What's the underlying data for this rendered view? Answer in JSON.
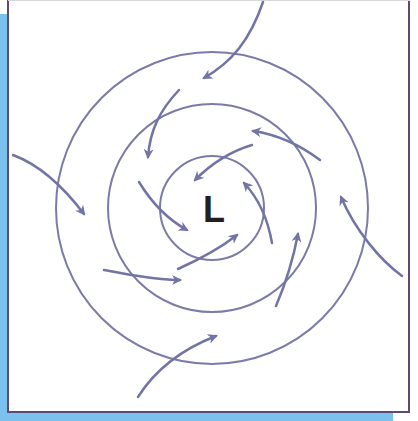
{
  "diagram": {
    "center_label": "L",
    "colors": {
      "background_accent": "#7cc0ee",
      "border": "#5b4b73",
      "isobar": "#7b7aa9",
      "arrow": "#7274a6",
      "label": "#231f20"
    },
    "center": {
      "x": 212,
      "y": 208
    },
    "isobars": [
      {
        "name": "inner",
        "r": 52
      },
      {
        "name": "middle",
        "r": 104
      },
      {
        "name": "outer",
        "r": 156
      }
    ],
    "arrows": [
      {
        "name": "top",
        "path": "M263,2 C250,40 232,62 204,78"
      },
      {
        "name": "left",
        "path": "M13,155 C40,165 62,185 84,214"
      },
      {
        "name": "right",
        "path": "M402,276 C380,260 355,230 341,197"
      },
      {
        "name": "bottom",
        "path": "M138,397 C155,370 180,350 216,336"
      },
      {
        "name": "upper-left-inner",
        "path": "M179,90 C160,110 150,130 148,157"
      },
      {
        "name": "upper-right",
        "path": "M320,160 C300,145 280,135 253,131"
      },
      {
        "name": "inner-top",
        "path": "M252,145 C235,150 215,160 195,180"
      },
      {
        "name": "inner-left",
        "path": "M139,182 C150,200 165,218 187,230"
      },
      {
        "name": "inner-right",
        "path": "M272,243 C268,220 260,200 244,183"
      },
      {
        "name": "inner-bottom",
        "path": "M178,269 C198,260 218,250 237,235"
      },
      {
        "name": "lower-left",
        "path": "M104,270 C128,274 152,280 180,280"
      },
      {
        "name": "lower-right",
        "path": "M276,306 C285,285 293,260 298,234"
      }
    ]
  }
}
